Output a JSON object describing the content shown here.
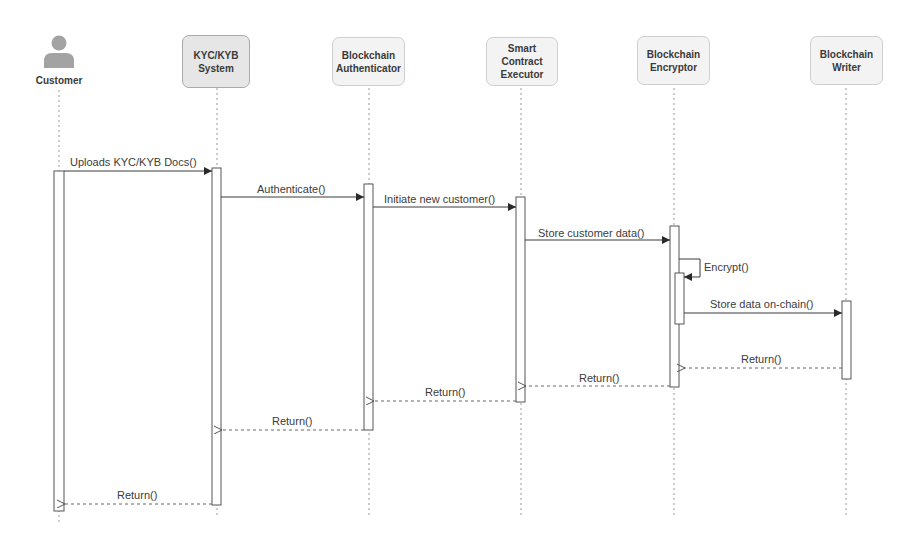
{
  "diagram": {
    "type": "sequence",
    "participants": [
      {
        "id": "customer",
        "label": "Customer",
        "kind": "actor",
        "x": 59
      },
      {
        "id": "kyc",
        "label": "KYC/KYB\nSystem",
        "kind": "box",
        "x": 217,
        "highlight": true
      },
      {
        "id": "auth",
        "label": "Blockchain\nAuthenticator",
        "kind": "box",
        "x": 369
      },
      {
        "id": "exec",
        "label": "Smart\nContract\nExecutor",
        "kind": "box",
        "x": 521
      },
      {
        "id": "enc",
        "label": "Blockchain\nEncryptor",
        "kind": "box",
        "x": 674
      },
      {
        "id": "writer",
        "label": "Blockchain\nWriter",
        "kind": "box",
        "x": 846
      }
    ],
    "messages": [
      {
        "from": "customer",
        "to": "kyc",
        "label": "Uploads KYC/KYB Docs()",
        "type": "sync",
        "y": 170
      },
      {
        "from": "kyc",
        "to": "auth",
        "label": "Authenticate()",
        "type": "sync",
        "y": 197
      },
      {
        "from": "auth",
        "to": "exec",
        "label": "Initiate new customer()",
        "type": "sync",
        "y": 207
      },
      {
        "from": "exec",
        "to": "enc",
        "label": "Store customer data()",
        "type": "sync",
        "y": 240
      },
      {
        "from": "enc",
        "to": "enc",
        "label": "Encrypt()",
        "type": "self",
        "y": 259
      },
      {
        "from": "enc",
        "to": "writer",
        "label": "Store data on-chain()",
        "type": "sync",
        "y": 313
      },
      {
        "from": "writer",
        "to": "enc",
        "label": "Return()",
        "type": "return",
        "y": 368
      },
      {
        "from": "enc",
        "to": "exec",
        "label": "Return()",
        "type": "return",
        "y": 386
      },
      {
        "from": "exec",
        "to": "auth",
        "label": "Return()",
        "type": "return",
        "y": 401
      },
      {
        "from": "auth",
        "to": "kyc",
        "label": "Return()",
        "type": "return",
        "y": 430
      },
      {
        "from": "kyc",
        "to": "customer",
        "label": "Return()",
        "type": "return",
        "y": 504
      }
    ]
  },
  "labels": {
    "customer": "Customer",
    "kyc": "KYC/KYB\nSystem",
    "auth": "Blockchain\nAuthenticator",
    "exec": "Smart\nContract\nExecutor",
    "enc": "Blockchain\nEncryptor",
    "writer": "Blockchain\nWriter",
    "m1": "Uploads KYC/KYB Docs()",
    "m2": "Authenticate()",
    "m3": "Initiate new customer()",
    "m4": "Store customer data()",
    "m5": "Encrypt()",
    "m6": "Store data on-chain()",
    "r1": "Return()",
    "r2": "Return()",
    "r3": "Return()",
    "r4": "Return()",
    "r5": "Return()"
  },
  "colors": {
    "line": "#4a4a4a",
    "lifeline": "#9a9a9a",
    "box_fill": "#f3f3f3",
    "box_border": "#cfcfcf",
    "actor": "#a3a3a3",
    "text": "#3a3a3a"
  }
}
